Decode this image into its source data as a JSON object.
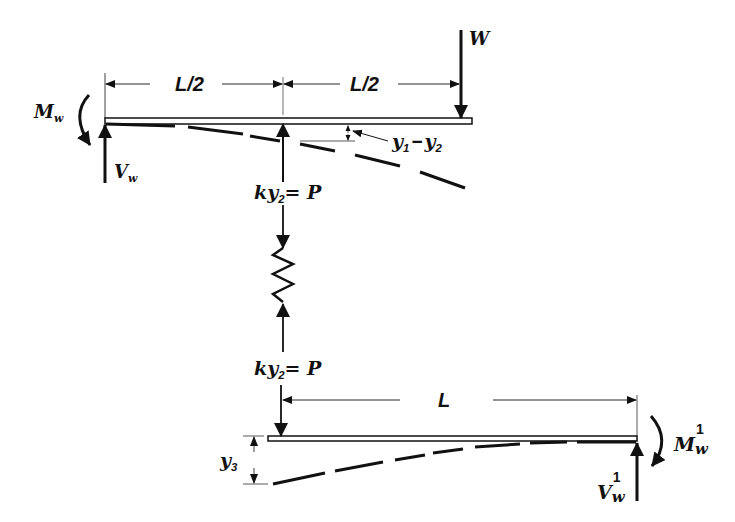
{
  "diagram": {
    "top_beam": {
      "dim_left": {
        "label": "L/2"
      },
      "dim_right": {
        "label": "L/2"
      },
      "load": {
        "symbol": "W"
      },
      "moment": {
        "symbol": "M",
        "subscript": "w"
      },
      "shear": {
        "symbol": "V",
        "subscript": "w"
      },
      "deflection": {
        "symbol1": "y",
        "sub1": "1",
        "operator": "−",
        "symbol2": "y",
        "sub2": "2"
      },
      "spring_force": {
        "lhs": "ky",
        "sub": "2",
        "rhs": "= P"
      }
    },
    "spring": {
      "label": "spring"
    },
    "bottom_beam": {
      "spring_force": {
        "lhs": "ky",
        "sub": "2",
        "rhs": "= P"
      },
      "dim": {
        "label": "L"
      },
      "deflection": {
        "symbol": "y",
        "sub": "3"
      },
      "moment": {
        "symbol": "M",
        "subscript": "w",
        "superscript": "1"
      },
      "shear": {
        "symbol": "V",
        "subscript": "w",
        "superscript": "1"
      }
    },
    "colors": {
      "ink": "#111111",
      "background": "#ffffff"
    }
  }
}
